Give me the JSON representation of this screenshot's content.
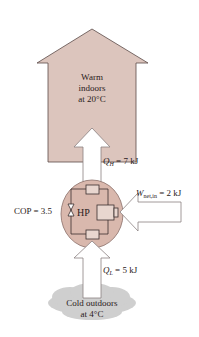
{
  "warm_region": {
    "line1": "Warm",
    "line2": "indoors",
    "line3": "at 20°C"
  },
  "cold_region": {
    "line1": "Cold outdoors",
    "line2": "at 4°C"
  },
  "heat_pump": {
    "label": "HP",
    "cop_label": "COP = 3.5"
  },
  "flows": {
    "q_high": {
      "symbol": "Q",
      "subscript": "H",
      "value": " = 7 kJ"
    },
    "q_low": {
      "symbol": "Q",
      "subscript": "L",
      "value": " = 5 kJ"
    },
    "work_in": {
      "symbol": "W",
      "subscript": "net,in",
      "value": " = 2 kJ"
    }
  },
  "colors": {
    "house_fill": "#dcc5bd",
    "circle_fill": "#d9b8ad",
    "arrow_fill": "#ffffff",
    "outline": "#5a4a48",
    "cloud": "#c8c8c8"
  }
}
